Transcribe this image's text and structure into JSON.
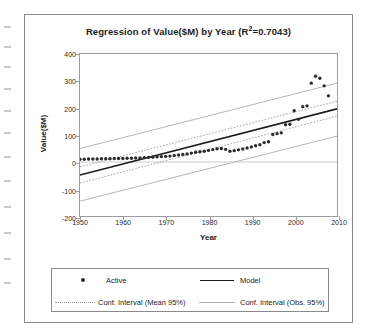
{
  "figure": {
    "title_main": "Regression of Value($M) by Year (R",
    "title_sup": "2",
    "title_tail": "=0.7043)",
    "title_full": "Regression of Value($M) by Year (R²=0.7043)"
  },
  "legend": {
    "items": [
      {
        "label": "Active",
        "marker": "dot",
        "color": "#2b2b2b"
      },
      {
        "label": "Model",
        "marker": "solid-line",
        "color": "#1a1a1a"
      },
      {
        "label": "Conf. Interval (Mean 95%)",
        "marker": "dotted-line",
        "color": "#9a9a9a"
      },
      {
        "label": "Conf. Interval (Obs. 95%)",
        "marker": "thin-line",
        "color": "#adadad"
      }
    ]
  },
  "chart_data": {
    "type": "scatter",
    "xlabel": "Year",
    "ylabel": "Value($M)",
    "xlim": [
      1950,
      2010
    ],
    "ylim": [
      -200,
      400
    ],
    "xticks": [
      1950,
      1960,
      1970,
      1980,
      1990,
      2000,
      2010
    ],
    "yticks": [
      -200,
      -100,
      0,
      100,
      200,
      300,
      400
    ],
    "grid": false,
    "legend_position": "below-plot",
    "r_squared": 0.7043,
    "series": [
      {
        "name": "Active",
        "type": "scatter",
        "marker": "dot",
        "color": "#2b2b2b",
        "x": [
          1950,
          1951,
          1952,
          1953,
          1954,
          1955,
          1956,
          1957,
          1958,
          1959,
          1960,
          1961,
          1962,
          1963,
          1964,
          1965,
          1966,
          1967,
          1968,
          1969,
          1970,
          1971,
          1972,
          1973,
          1974,
          1975,
          1976,
          1977,
          1978,
          1979,
          1980,
          1981,
          1982,
          1983,
          1984,
          1985,
          1986,
          1987,
          1988,
          1989,
          1990,
          1991,
          1992,
          1993,
          1994,
          1995,
          1996,
          1997,
          1998,
          1999,
          2000,
          2001,
          2002,
          2003,
          2004,
          2005,
          2006,
          2007,
          2008
        ],
        "y": [
          10,
          10,
          11,
          11,
          11,
          12,
          12,
          12,
          13,
          13,
          13,
          14,
          14,
          15,
          15,
          16,
          17,
          18,
          19,
          20,
          21,
          22,
          24,
          26,
          28,
          30,
          33,
          36,
          38,
          40,
          43,
          46,
          49,
          50,
          47,
          40,
          42,
          45,
          48,
          52,
          56,
          60,
          64,
          72,
          75,
          102,
          105,
          108,
          138,
          140,
          190,
          158,
          205,
          208,
          292,
          318,
          310,
          282,
          245
        ]
      },
      {
        "name": "Model",
        "type": "line",
        "color": "#1a1a1a",
        "x": [
          1950,
          2010
        ],
        "y": [
          -48,
          197
        ],
        "slope": 4.083,
        "intercept_at_1950": -48
      },
      {
        "name": "Conf. Interval (Mean 95%) upper",
        "type": "line",
        "style": "dotted",
        "color": "#9a9a9a",
        "x": [
          1950,
          2010
        ],
        "y": [
          -18,
          225
        ]
      },
      {
        "name": "Conf. Interval (Mean 95%) lower",
        "type": "line",
        "style": "dotted",
        "color": "#9a9a9a",
        "x": [
          1950,
          2010
        ],
        "y": [
          -78,
          170
        ]
      },
      {
        "name": "Conf. Interval (Obs. 95%) upper",
        "type": "line",
        "style": "solid-thin",
        "color": "#adadad",
        "x": [
          1950,
          2010
        ],
        "y": [
          50,
          292
        ]
      },
      {
        "name": "Conf. Interval (Obs. 95%) lower",
        "type": "line",
        "style": "solid-thin",
        "color": "#adadad",
        "x": [
          1950,
          2010
        ],
        "y": [
          -145,
          96
        ]
      }
    ]
  }
}
